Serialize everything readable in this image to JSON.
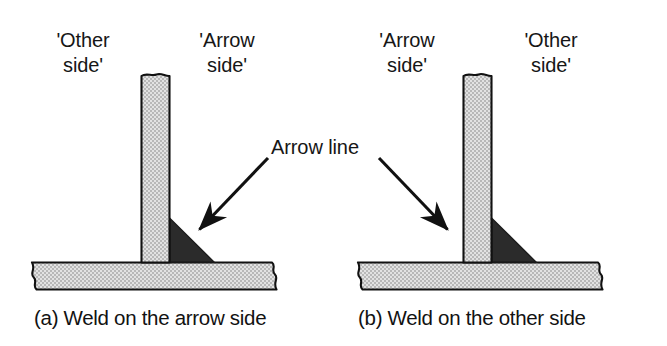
{
  "figure": {
    "background_color": "#ffffff",
    "ink_color": "#000000",
    "plate_fill_color": "#d2d2d2",
    "weld_fill_color": "#2b2b2b"
  },
  "shared": {
    "arrow_line_label": "Arrow line"
  },
  "panels": [
    {
      "id": "panel-a",
      "caption": "(a) Weld on the arrow side",
      "left_label": "'Other\nside'",
      "right_label": "'Arrow\nside'",
      "weld_position": "right of vertical plate",
      "arrow_direction": "down-left"
    },
    {
      "id": "panel-b",
      "caption": "(b) Weld on the other side",
      "left_label": "'Arrow\nside'",
      "right_label": "'Other\nside'",
      "weld_position": "right of vertical plate",
      "arrow_direction": "down-right"
    }
  ]
}
